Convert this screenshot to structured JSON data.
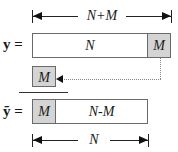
{
  "top_dimension": {
    "label": "N+M"
  },
  "y_row": {
    "symbol": "y =",
    "segments": [
      {
        "label": "N",
        "shaded": false
      },
      {
        "label": "M",
        "shaded": true
      }
    ]
  },
  "moved_block": {
    "label": "M",
    "shaded": true
  },
  "y_tilde_row": {
    "symbol": "ỹ =",
    "segments": [
      {
        "label": "M",
        "shaded": true
      },
      {
        "label": "N-M",
        "shaded": false
      }
    ]
  },
  "bottom_dimension": {
    "label": "N"
  },
  "colors": {
    "shaded_fill": "#d4d4d4",
    "border": "#6a6a6a",
    "dotted_connector": "#888888"
  }
}
